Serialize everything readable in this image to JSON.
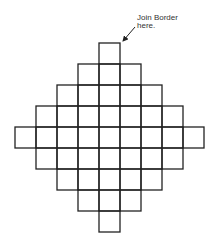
{
  "diagram": {
    "annotation": {
      "line1": "Join Border",
      "line2": "here."
    },
    "grid": {
      "cell_size": 21,
      "rows": [
        1,
        3,
        5,
        7,
        9,
        7,
        5,
        3,
        1
      ],
      "origin_center_x": 109.5,
      "origin_top_y": 43
    },
    "colors": {
      "stroke": "#222222",
      "background": "#ffffff"
    }
  }
}
